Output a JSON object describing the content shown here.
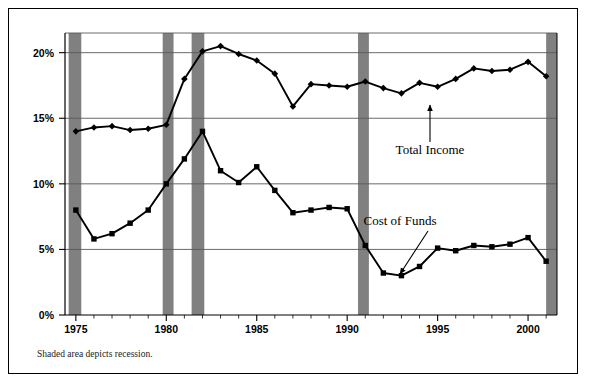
{
  "figure": {
    "caption": "Shaded area depicts recession.",
    "background_color": "#ffffff",
    "border_color": "#000000"
  },
  "chart_data": {
    "type": "line",
    "title": "",
    "xlabel": "",
    "ylabel": "",
    "xlim": [
      1974.4,
      2001.6
    ],
    "ylim": [
      0,
      21.5
    ],
    "grid": true,
    "grid_axis": "y",
    "legend_position": "inline-annotations",
    "x": [
      1975,
      1976,
      1977,
      1978,
      1979,
      1980,
      1981,
      1982,
      1983,
      1984,
      1985,
      1986,
      1987,
      1988,
      1989,
      1990,
      1991,
      1992,
      1993,
      1994,
      1995,
      1996,
      1997,
      1998,
      1999,
      2000,
      2001
    ],
    "xticks": [
      1975,
      1980,
      1985,
      1990,
      1995,
      2000
    ],
    "xticklabels": [
      "1975",
      "1980",
      "1985",
      "1990",
      "1995",
      "2000"
    ],
    "yticks": [
      0,
      5,
      10,
      15,
      20
    ],
    "yticklabels": [
      "0%",
      "5%",
      "10%",
      "15%",
      "20%"
    ],
    "series": [
      {
        "name": "Total Income",
        "marker": "diamond",
        "color": "#000000",
        "values": [
          14.0,
          14.3,
          14.4,
          14.1,
          14.2,
          14.5,
          18.0,
          20.1,
          20.5,
          19.9,
          19.4,
          18.4,
          15.9,
          17.6,
          17.5,
          17.4,
          17.8,
          17.3,
          16.9,
          17.7,
          17.4,
          18.0,
          18.8,
          18.6,
          18.7,
          19.3,
          18.2
        ]
      },
      {
        "name": "Cost of Funds",
        "marker": "square",
        "color": "#000000",
        "values": [
          8.0,
          5.8,
          6.2,
          7.0,
          8.0,
          10.0,
          11.9,
          14.0,
          11.0,
          10.1,
          11.3,
          9.5,
          7.8,
          8.0,
          8.2,
          8.1,
          5.3,
          3.2,
          3.0,
          3.7,
          5.1,
          4.9,
          5.3,
          5.2,
          5.4,
          5.9,
          4.1
        ]
      }
    ],
    "recession_bands": [
      {
        "start": 1974.6,
        "end": 1975.3
      },
      {
        "start": 1979.8,
        "end": 1980.4
      },
      {
        "start": 1981.4,
        "end": 1982.1
      },
      {
        "start": 1990.6,
        "end": 1991.2
      },
      {
        "start": 2001.0,
        "end": 2001.6
      }
    ],
    "recession_band_color": "#808080",
    "annotations": [
      {
        "name": "total-income",
        "label": "Total Income",
        "text_x": 421,
        "text_y": 145,
        "arrow_from_x": 421,
        "arrow_from_y": 133,
        "arrow_to_x": 421,
        "arrow_to_y": 96
      },
      {
        "name": "cost-of-funds",
        "label": "Cost of Funds",
        "text_x": 391,
        "text_y": 216,
        "arrow_from_x": 419,
        "arrow_from_y": 222,
        "arrow_to_x": 391,
        "arrow_to_y": 265
      }
    ]
  }
}
